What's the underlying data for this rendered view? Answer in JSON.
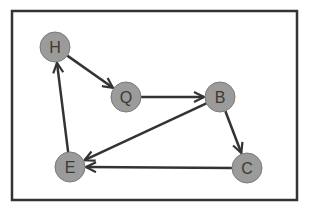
{
  "diagram": {
    "type": "directed-graph",
    "frame": {
      "x": 12,
      "y": 11,
      "width": 285,
      "height": 189,
      "stroke": "#333333"
    },
    "node_style": {
      "radius": 15,
      "fill": "#9b9b9b",
      "stroke": "#7a7a7a"
    },
    "edge_color": "#333333",
    "nodes": [
      {
        "id": "H",
        "label": "H",
        "x": 55,
        "y": 47
      },
      {
        "id": "Q",
        "label": "Q",
        "x": 126,
        "y": 97
      },
      {
        "id": "B",
        "label": "B",
        "x": 220,
        "y": 97
      },
      {
        "id": "C",
        "label": "C",
        "x": 247,
        "y": 168
      },
      {
        "id": "E",
        "label": "E",
        "x": 70,
        "y": 167
      }
    ],
    "edges": [
      {
        "from": "H",
        "to": "Q"
      },
      {
        "from": "Q",
        "to": "B"
      },
      {
        "from": "B",
        "to": "C"
      },
      {
        "from": "B",
        "to": "E"
      },
      {
        "from": "C",
        "to": "E"
      },
      {
        "from": "E",
        "to": "H"
      }
    ]
  }
}
